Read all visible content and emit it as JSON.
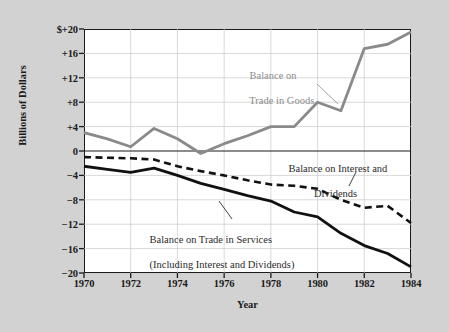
{
  "chart_data": {
    "type": "line",
    "title": "",
    "xlabel": "Year",
    "ylabel": "Billions of Dollars",
    "x": [
      1970,
      1971,
      1972,
      1973,
      1974,
      1975,
      1976,
      1977,
      1978,
      1979,
      1980,
      1981,
      1982,
      1983,
      1984
    ],
    "xlim": [
      1970,
      1984
    ],
    "ylim": [
      -20,
      20
    ],
    "xticks": [
      "1970",
      "1972",
      "1974",
      "1976",
      "1978",
      "1980",
      "1982",
      "1984"
    ],
    "xtick_values": [
      1970,
      1972,
      1974,
      1976,
      1978,
      1980,
      1982,
      1984
    ],
    "yticks": [
      "$+20",
      "+16",
      "+12",
      "+8",
      "+4",
      "0",
      "−4",
      "−8",
      "−12",
      "−16",
      "−20"
    ],
    "ytick_values": [
      20,
      16,
      12,
      8,
      4,
      0,
      -4,
      -8,
      -12,
      -16,
      -20
    ],
    "grid": true,
    "legend_position": "inline-annotations",
    "series": [
      {
        "name": "Balance on Trade in Goods",
        "color": "#8a8a8a",
        "style": "solid",
        "values": [
          3.0,
          2.0,
          0.7,
          3.7,
          2.0,
          -0.4,
          1.2,
          2.5,
          4.0,
          4.0,
          8.0,
          6.6,
          16.8,
          17.5,
          19.5
        ]
      },
      {
        "name": "Balance on Interest and Dividends",
        "color": "#111111",
        "style": "dashed",
        "values": [
          -1.0,
          -1.1,
          -1.2,
          -1.4,
          -2.5,
          -3.3,
          -4.0,
          -4.8,
          -5.5,
          -5.7,
          -6.2,
          -8.0,
          -9.3,
          -9.0,
          -11.8
        ]
      },
      {
        "name": "Balance on Trade in Services (Including Interest and Dividends)",
        "color": "#111111",
        "style": "solid",
        "values": [
          -2.5,
          -3.0,
          -3.5,
          -2.8,
          -4.0,
          -5.3,
          -6.3,
          -7.3,
          -8.2,
          -10.0,
          -10.8,
          -13.5,
          -15.5,
          -16.8,
          -19.0
        ]
      }
    ],
    "annotations": [
      {
        "id": "goods",
        "line1": "Balance on",
        "line2": "Trade in Goods",
        "color": "#8c8c8c"
      },
      {
        "id": "interest",
        "line1": "Balance on Interest and",
        "line2": "Dividends",
        "color": "#2b2b2b"
      },
      {
        "id": "services",
        "line1": "Balance on Trade in Services",
        "line2": "(Including Interest and Dividends)",
        "color": "#2b2b2b"
      }
    ]
  },
  "figure": {
    "background_color": "#d2d2d2",
    "plot_background_color": "#ffffff",
    "axis_color": "#1a1a1a",
    "grid_color": "#c8c8c8"
  }
}
